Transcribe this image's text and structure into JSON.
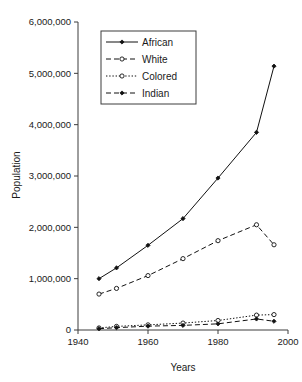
{
  "chart_data": {
    "type": "line",
    "title": "",
    "xlabel": "Years",
    "ylabel": "Population",
    "xlim": [
      1940,
      2000
    ],
    "ylim": [
      0,
      6000000
    ],
    "grid": false,
    "legend_position": "top-left-inside",
    "x_ticks": [
      "1940",
      "1960",
      "1980",
      "2000"
    ],
    "x_tick_values": [
      1940,
      1960,
      1980,
      2000
    ],
    "y_ticks": [
      "0",
      "1,000,000",
      "2,000,000",
      "3,000,000",
      "4,000,000",
      "5,000,000",
      "6,000,000"
    ],
    "y_tick_values": [
      0,
      1000000,
      2000000,
      3000000,
      4000000,
      5000000,
      6000000
    ],
    "x": [
      1946,
      1951,
      1960,
      1970,
      1980,
      1991,
      1996
    ],
    "series": [
      {
        "name": "African",
        "line_style": "solid",
        "marker": "filled-diamond",
        "color": "#111111",
        "values": [
          1000000,
          1210000,
          1650000,
          2170000,
          2960000,
          3850000,
          5140000
        ]
      },
      {
        "name": "White",
        "line_style": "dashed",
        "marker": "open-circle",
        "color": "#111111",
        "values": [
          700000,
          810000,
          1060000,
          1390000,
          1740000,
          2050000,
          1660000
        ]
      },
      {
        "name": "Colored",
        "line_style": "dotted",
        "marker": "open-circle",
        "color": "#111111",
        "values": [
          40000,
          70000,
          100000,
          135000,
          185000,
          290000,
          300000
        ]
      },
      {
        "name": "Indian",
        "line_style": "dashed",
        "marker": "filled-diamond",
        "color": "#111111",
        "values": [
          25000,
          45000,
          75000,
          90000,
          120000,
          215000,
          170000
        ]
      }
    ]
  },
  "legend": {
    "entries": [
      {
        "label": "African"
      },
      {
        "label": "White"
      },
      {
        "label": "Colored"
      },
      {
        "label": "Indian"
      }
    ]
  }
}
